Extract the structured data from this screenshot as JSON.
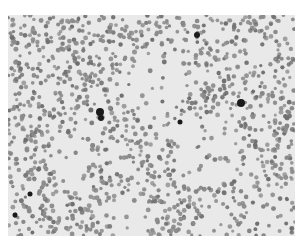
{
  "image": {
    "description": "Grayscale micrograph of a blood smear showing many red blood cells with a few darker stained cells",
    "background_color": "#e9e9e9",
    "cell_color": "#8a8a8a",
    "cell_dark_color": "#6f6f6f",
    "stain_color": "#1a1a1a",
    "dark_spots": [
      {
        "x": 92,
        "y": 97,
        "r": 4
      },
      {
        "x": 93,
        "y": 103,
        "r": 3
      },
      {
        "x": 189,
        "y": 20,
        "r": 3
      },
      {
        "x": 172,
        "y": 107,
        "r": 2.5
      },
      {
        "x": 233,
        "y": 88,
        "r": 4
      },
      {
        "x": 22,
        "y": 179,
        "r": 2.5
      },
      {
        "x": 7,
        "y": 200,
        "r": 2.5
      }
    ]
  }
}
